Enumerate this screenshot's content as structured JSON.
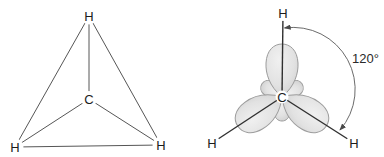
{
  "figure": {
    "left_diagram": {
      "center_atom": "C",
      "top_atom": "H",
      "bottom_left_atom": "H",
      "bottom_right_atom": "H"
    },
    "right_diagram": {
      "center_atom": "C",
      "top_atom": "H",
      "bottom_left_atom": "H",
      "bottom_right_atom": "H",
      "angle_label": "120°"
    },
    "colors": {
      "background": "#ffffff",
      "skeletal_line": "#565656",
      "bond_line": "#303030",
      "lobe_fill_light": "#f0f0f0",
      "lobe_fill_dark": "#d2d2d2",
      "lobe_stroke": "#9c9c9c",
      "arc_line": "#6b6b6b",
      "label_text": "#1c1c1c"
    }
  }
}
